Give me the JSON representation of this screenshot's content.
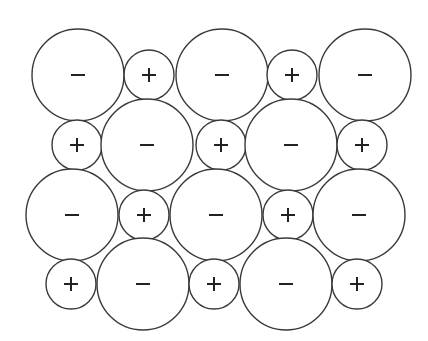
{
  "diagram": {
    "title": "",
    "stroke_color": "#3a3a3a",
    "sign_color": "#222222",
    "background": "#ffffff",
    "rows": [
      {
        "y": 75,
        "ions": [
          {
            "type": "anion",
            "sign": "−",
            "cx": 78,
            "r": 46
          },
          {
            "type": "cation",
            "sign": "+",
            "cx": 149,
            "r": 25
          },
          {
            "type": "anion",
            "sign": "−",
            "cx": 222,
            "r": 46
          },
          {
            "type": "cation",
            "sign": "+",
            "cx": 292,
            "r": 25
          },
          {
            "type": "anion",
            "sign": "−",
            "cx": 365,
            "r": 46
          }
        ]
      },
      {
        "y": 145,
        "ions": [
          {
            "type": "cation",
            "sign": "+",
            "cx": 77,
            "r": 25
          },
          {
            "type": "anion",
            "sign": "−",
            "cx": 147,
            "r": 46
          },
          {
            "type": "cation",
            "sign": "+",
            "cx": 221,
            "r": 25
          },
          {
            "type": "anion",
            "sign": "−",
            "cx": 291,
            "r": 46
          },
          {
            "type": "cation",
            "sign": "+",
            "cx": 362,
            "r": 25
          }
        ]
      },
      {
        "y": 215,
        "ions": [
          {
            "type": "anion",
            "sign": "−",
            "cx": 72,
            "r": 46
          },
          {
            "type": "cation",
            "sign": "+",
            "cx": 144,
            "r": 25
          },
          {
            "type": "anion",
            "sign": "−",
            "cx": 216,
            "r": 46
          },
          {
            "type": "cation",
            "sign": "+",
            "cx": 288,
            "r": 25
          },
          {
            "type": "anion",
            "sign": "−",
            "cx": 359,
            "r": 46
          }
        ]
      },
      {
        "y": 284,
        "ions": [
          {
            "type": "cation",
            "sign": "+",
            "cx": 71,
            "r": 25
          },
          {
            "type": "anion",
            "sign": "−",
            "cx": 143,
            "r": 46
          },
          {
            "type": "cation",
            "sign": "+",
            "cx": 214,
            "r": 25
          },
          {
            "type": "anion",
            "sign": "−",
            "cx": 286,
            "r": 46
          },
          {
            "type": "cation",
            "sign": "+",
            "cx": 357,
            "r": 25
          }
        ]
      }
    ]
  }
}
